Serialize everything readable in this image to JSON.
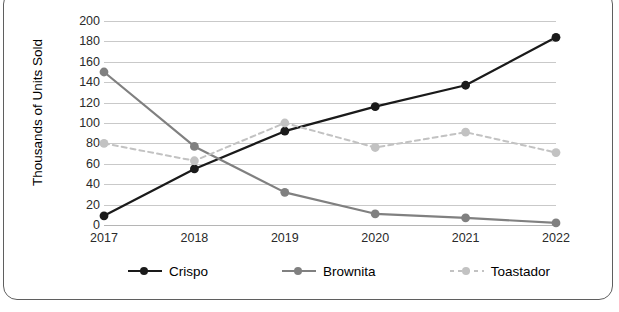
{
  "chart_data": {
    "type": "line",
    "title": "",
    "subtitle": "",
    "xlabel": "",
    "ylabel": "Thousands of Units Sold",
    "categories": [
      "2017",
      "2018",
      "2019",
      "2020",
      "2021",
      "2022"
    ],
    "x_tick_labels": [
      "2017",
      "2018",
      "2019",
      "2020",
      "2021",
      "2022"
    ],
    "y_tick_labels": [
      "200",
      "180",
      "160",
      "140",
      "120",
      "100",
      "80",
      "60",
      "40",
      "20",
      "0"
    ],
    "ylim": [
      0,
      200
    ],
    "y_tick_step": 20,
    "grid": "horizontal",
    "legend_position": "bottom",
    "series": [
      {
        "name": "Crispo",
        "color": "#1a1a1a",
        "style": "solid",
        "marker": "circle",
        "values": [
          9,
          55,
          92,
          116,
          137,
          184
        ]
      },
      {
        "name": "Brownita",
        "color": "#808080",
        "style": "solid",
        "marker": "circle",
        "values": [
          150,
          77,
          32,
          11,
          7,
          2
        ]
      },
      {
        "name": "Toastador",
        "color": "#c2c2c2",
        "style": "dashed",
        "marker": "circle",
        "values": [
          80,
          63,
          100,
          76,
          91,
          71
        ]
      }
    ]
  },
  "legend": {
    "items": [
      {
        "label": "Crispo"
      },
      {
        "label": "Brownita"
      },
      {
        "label": "Toastador"
      }
    ]
  },
  "colors": {
    "background": "#ffffff",
    "gridline": "#c9c9c9",
    "frame_border": "#5f5f5f",
    "axis_text": "#2a2a2a"
  }
}
